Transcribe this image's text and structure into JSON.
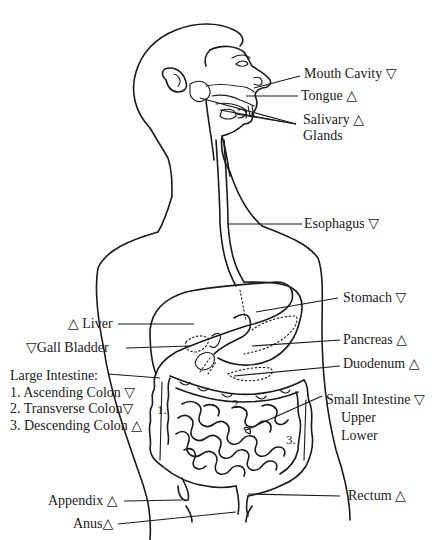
{
  "diagram": {
    "symbols": {
      "up": "△",
      "down": "▽"
    },
    "labels": {
      "mouth_cavity": "Mouth Cavity ▽",
      "tongue": "Tongue △",
      "salivary_line1": "Salivary  △",
      "salivary_line2": "Glands",
      "esophagus": "Esophagus ▽",
      "stomach": "Stomach ▽",
      "liver": "△ Liver",
      "gall_bladder": "▽Gall Bladder",
      "pancreas": "Pancreas △",
      "duodenum": "Duodenum  △",
      "large_intestine": "Large Intestine:",
      "ascending_colon": "1. Ascending Colon ▽",
      "transverse_colon": "2. Transverse Colon▽",
      "descending_colon": "3. Descending Colon △",
      "small_intestine": "Small Intestine ▽",
      "upper": "Upper",
      "lower": "Lower",
      "appendix": "Appendix △",
      "anus": "Anus△",
      "rectum": "Rectum △"
    },
    "region_numbers": {
      "n1": "1.",
      "n2": "2.",
      "n3": "3."
    }
  }
}
